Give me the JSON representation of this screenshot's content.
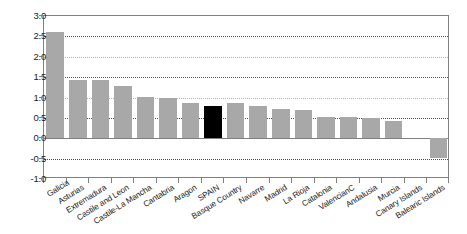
{
  "chart_data": {
    "type": "bar",
    "title": "",
    "subtitle": "",
    "xlabel": "",
    "ylabel": "",
    "ylim": [
      -1.0,
      3.0
    ],
    "grid": true,
    "grid_axis": "y",
    "legend": "none",
    "highlight_category": "SPAIN",
    "highlight_color": "#000000",
    "bar_color": "#a8a8a8",
    "yticks": [
      "-1.0",
      "-0.5",
      "0.0",
      "0.5",
      "1.0",
      "1.5",
      "2.0",
      "2.5",
      "3.0"
    ],
    "ytick_values": [
      -1.0,
      -0.5,
      0.0,
      0.5,
      1.0,
      1.5,
      2.0,
      2.5,
      3.0
    ],
    "gridline_values": [
      2.5,
      2.0,
      1.5,
      1.0,
      0.5,
      -0.5
    ],
    "categories": [
      "Galicia",
      "Asturias",
      "Extremadura",
      "Castile and Leon",
      "Castile-La Mancha",
      "Cantabria",
      "Aragon",
      "SPAIN",
      "Basque Country",
      "Navarre",
      "Madrid",
      "La Rioja",
      "Catalonia",
      "ValencianC",
      "Andalusia",
      "Murcia",
      "Canary Islands",
      "Balearic Islands"
    ],
    "values": [
      2.6,
      1.42,
      1.42,
      1.27,
      1.02,
      1.0,
      0.87,
      0.8,
      0.87,
      0.78,
      0.72,
      0.7,
      0.53,
      0.52,
      0.5,
      0.42,
      0.0,
      -0.48
    ]
  }
}
